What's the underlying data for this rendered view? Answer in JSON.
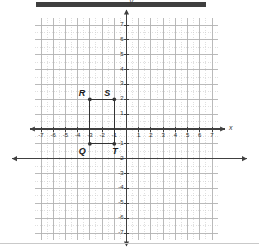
{
  "figure": {
    "kind": "coordinate-plane-graph",
    "header_bar_color": "#3f3f3f",
    "background_color": "#ffffff",
    "axis_color": "#404040",
    "major_grid_color": "#b3b3b3",
    "minor_grid_color": "#cccccc",
    "shape_color": "#333333"
  },
  "chart_data": {
    "type": "scatter",
    "title": "",
    "xlabel": "x",
    "ylabel": "y",
    "xlim": [
      -7.5,
      7.5
    ],
    "ylim": [
      -7.5,
      7.5
    ],
    "grid": true,
    "minor_grid": true,
    "minor_grid_step": 0.5,
    "legend": "none",
    "x_ticks": [
      -7,
      -6,
      -5,
      -4,
      -3,
      -2,
      -1,
      1,
      2,
      3,
      4,
      5,
      6,
      7
    ],
    "y_ticks": [
      7,
      6,
      5,
      4,
      3,
      2,
      1,
      -1,
      -2,
      -3,
      -4,
      -5,
      -6,
      -7
    ],
    "x_tick_labels": [
      "-7",
      "-6",
      "-5",
      "-4",
      "-3",
      "-2",
      "-1",
      "1",
      "2",
      "3",
      "4",
      "5",
      "6",
      "7"
    ],
    "y_tick_labels": [
      "7",
      "6",
      "5",
      "4",
      "3",
      "2",
      "1",
      "-1",
      "-2",
      "-3",
      "-4",
      "-5",
      "-6",
      "-7"
    ],
    "points": [
      {
        "name": "R",
        "x": -3,
        "y": 2,
        "label": "R",
        "label_dx": -11,
        "label_dy": -11
      },
      {
        "name": "S",
        "x": -1,
        "y": 2,
        "label": "S",
        "label_dx": -10,
        "label_dy": -11
      },
      {
        "name": "Q",
        "x": -3,
        "y": -1,
        "label": "Q",
        "label_dx": -11,
        "label_dy": 2
      },
      {
        "name": "T",
        "x": -1,
        "y": -1,
        "label": "T",
        "label_dx": -2,
        "label_dy": 2
      }
    ],
    "segments": [
      {
        "from": "R",
        "to": "S"
      },
      {
        "from": "S",
        "to": "T"
      },
      {
        "from": "T",
        "to": "Q"
      },
      {
        "from": "Q",
        "to": "R"
      }
    ],
    "annotations": {
      "axis_x_label": "x",
      "axis_y_label": "y",
      "stray_horizontal_arrow_y": -2
    }
  }
}
